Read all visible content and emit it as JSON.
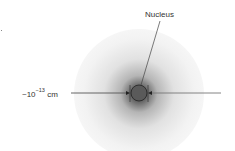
{
  "diagram": {
    "title_label": "Nucleus",
    "scale_label": {
      "prefix": "~10",
      "exponent": "−13",
      "unit": "cm"
    },
    "colors": {
      "line": "#555555",
      "nucleus_fill": "#5a5a5a",
      "nucleus_stroke": "#222222",
      "text": "#333333"
    }
  }
}
